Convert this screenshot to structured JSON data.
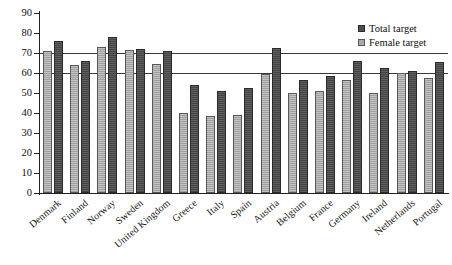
{
  "chart_data": {
    "type": "bar",
    "title": "",
    "subtitle": "",
    "xlabel": "",
    "ylabel": "",
    "ylim": [
      0,
      90
    ],
    "yticks": [
      0,
      10,
      20,
      30,
      40,
      50,
      60,
      70,
      80,
      90
    ],
    "ytick_labels": [
      "0",
      "10",
      "20",
      "30",
      "40",
      "50",
      "60",
      "70",
      "80",
      "90"
    ],
    "grid": false,
    "legend_position": "top-right",
    "categories": [
      "Denmark",
      "Finland",
      "Norway",
      "Sweden",
      "United Kingdom",
      "Greece",
      "Italy",
      "Spain",
      "Austria",
      "Belgium",
      "France",
      "Germany",
      "Ireland",
      "Netherlands",
      "Portugal"
    ],
    "series": [
      {
        "name": "Female target",
        "color": "#a9a9a9",
        "values": [
          71,
          64,
          73,
          71.5,
          64.5,
          40,
          38.5,
          39,
          59.5,
          50,
          51,
          56.5,
          50,
          60,
          57.5
        ]
      },
      {
        "name": "Total target",
        "color": "#4d4d4d",
        "values": [
          76,
          66,
          78,
          72,
          71,
          54,
          51,
          52.5,
          72.5,
          56.5,
          58.5,
          66,
          62.5,
          61,
          65.5
        ]
      }
    ],
    "reference_lines": [
      {
        "label": "70",
        "value": 70,
        "color": "#3a3a3a"
      },
      {
        "label": "60",
        "value": 60,
        "color": "#3a3a3a"
      }
    ]
  },
  "legend": {
    "items": [
      {
        "label": "Total target",
        "swatch": "total"
      },
      {
        "label": "Female target",
        "swatch": "female"
      }
    ]
  }
}
